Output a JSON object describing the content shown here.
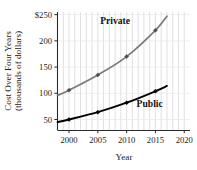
{
  "chart_data": {
    "type": "line",
    "title": "",
    "xlabel": "Year",
    "ylabel": "Cost Over Four Years",
    "ylabel_line2": "(thousands of dollars)",
    "xlim": [
      1998,
      2021
    ],
    "ylim": [
      30,
      255
    ],
    "xticks": [
      2000,
      2005,
      2010,
      2015,
      2020
    ],
    "xtick_labels": [
      "2000",
      "2005",
      "2010",
      "2015",
      "2020"
    ],
    "yticks": [
      50,
      100,
      150,
      200,
      250
    ],
    "ytick_labels": [
      "50",
      "100",
      "150",
      "200",
      "$250"
    ],
    "grid": "vertical-minor",
    "legend_position": "inline-annotations",
    "series": [
      {
        "name": "Private",
        "label": "Private",
        "color": "#7a7a7a",
        "marker": "diamond",
        "x": [
          1998,
          2000,
          2005,
          2010,
          2015,
          2017
        ],
        "values": [
          96,
          106,
          135,
          170,
          220,
          247
        ],
        "marker_x": [
          2000,
          2005,
          2010,
          2015
        ],
        "marker_values": [
          106,
          135,
          170,
          220
        ]
      },
      {
        "name": "Public",
        "label": "Public",
        "color": "#000000",
        "marker": "diamond",
        "x": [
          1998,
          2000,
          2005,
          2010,
          2015,
          2017
        ],
        "values": [
          45,
          50,
          64,
          82,
          104,
          114
        ],
        "marker_x": [
          2000,
          2005,
          2010,
          2015
        ],
        "marker_values": [
          50,
          64,
          82,
          104
        ]
      }
    ],
    "annotations": [
      {
        "text": "Private",
        "x": 2008.0,
        "y": 232
      },
      {
        "text": "Public",
        "x": 2014.0,
        "y": 74
      }
    ]
  },
  "colors": {
    "background": "#ffffff",
    "axis": "#2b2b2b",
    "gridline": "#d8d8dc",
    "private_series": "#7a7a7a",
    "public_series": "#000000",
    "text": "#1a1a1a"
  }
}
